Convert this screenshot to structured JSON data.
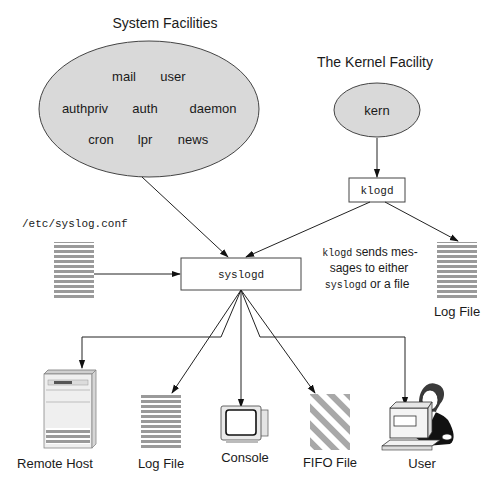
{
  "titles": {
    "system_facilities": "System Facilities",
    "kernel_facility": "The Kernel Facility"
  },
  "system_facilities": {
    "items": [
      "mail",
      "user",
      "authpriv",
      "auth",
      "daemon",
      "cron",
      "lpr",
      "news"
    ]
  },
  "kernel": {
    "item": "kern"
  },
  "daemons": {
    "klogd": "klogd",
    "syslogd": "syslogd"
  },
  "config": {
    "path": "/etc/syslog.conf"
  },
  "note": {
    "line1_code": "klogd",
    "line1_text": " sends mes-",
    "line2_text": "sages to either",
    "line3_code": "syslogd",
    "line3_text": " or a file"
  },
  "outputs": {
    "klogd_log_file": "Log File",
    "remote_host": "Remote Host",
    "log_file": "Log File",
    "console": "Console",
    "fifo_file": "FIFO File",
    "user": "User"
  },
  "colors": {
    "ellipse_fill": "#d9d9d9",
    "file_stripe": "#9a9a9a",
    "line": "#222222"
  }
}
